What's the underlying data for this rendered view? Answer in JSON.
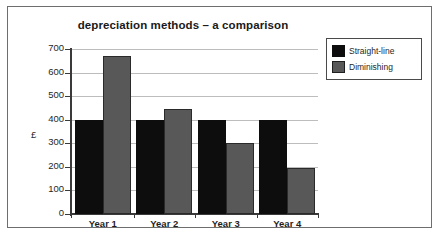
{
  "chart_data": {
    "type": "bar",
    "title": "depreciation methods – a comparison",
    "xlabel": "",
    "ylabel": "£",
    "categories": [
      "Year 1",
      "Year 2",
      "Year 3",
      "Year 4"
    ],
    "series": [
      {
        "name": "Straight-line",
        "color": "#0d0d0d",
        "values": [
          400,
          400,
          400,
          400
        ]
      },
      {
        "name": "Diminishing",
        "color": "#585858",
        "values": [
          670,
          445,
          300,
          195
        ]
      }
    ],
    "ylim": [
      0,
      700
    ],
    "yticks": [
      0,
      100,
      200,
      300,
      400,
      500,
      600,
      700
    ],
    "ytick_labels": [
      "0",
      "100",
      "200",
      "300",
      "400",
      "500",
      "600",
      "700"
    ],
    "grid": true,
    "legend_position": "right-top"
  },
  "legend": {
    "entries": [
      {
        "label": "Straight-line"
      },
      {
        "label": "Diminishing"
      }
    ]
  }
}
